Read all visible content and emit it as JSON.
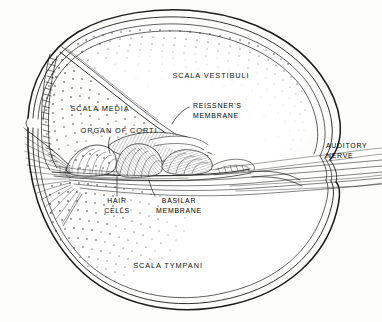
{
  "figure": {
    "type": "anatomical-line-drawing",
    "ink_color": "#1a1a1a",
    "background_color": "#fdfdfb",
    "width": 382,
    "height": 322
  },
  "labels": {
    "scala_vestibuli": {
      "text": "SCALA VESTIBULI",
      "x": 211,
      "y": 78
    },
    "scala_media": {
      "text": "SCALA MEDIA",
      "x": 100,
      "y": 111
    },
    "organ_of_corti": {
      "text": "ORGAN OF CORTI",
      "x": 119,
      "y": 133
    },
    "reissners_membrane": {
      "line1": "REISSNER'S",
      "line2": "MEMBRANE",
      "x": 225,
      "y": 111
    },
    "basilar_membrane": {
      "line1": "BASILAR",
      "line2": "MEMBRANE",
      "x": 172,
      "y": 203
    },
    "hair_cells": {
      "line1": "HAIR",
      "line2": "CELLS",
      "x": 117,
      "y": 203
    },
    "auditory_nerve": {
      "line1": "AUDITORY",
      "line2": "NERVE",
      "x": 347,
      "y": 150
    },
    "scala_tympani": {
      "text": "SCALA TYMPANI",
      "x": 168,
      "y": 268
    }
  },
  "structures": [
    {
      "name": "bony-capsule-outer-wall",
      "description": "multi-line outer contour of the cochlear turn"
    },
    {
      "name": "scala-vestibuli-chamber",
      "description": "upper large chamber, stippled near walls"
    },
    {
      "name": "scala-media-chamber",
      "description": "triangular duct, heavily stippled"
    },
    {
      "name": "scala-tympani-chamber",
      "description": "lower chamber, stippled at left"
    },
    {
      "name": "reissners-membrane-line",
      "description": "thin diagonal membrane separating vestibuli from media"
    },
    {
      "name": "basilar-membrane-line",
      "description": "horizontal membrane floor of scala media"
    },
    {
      "name": "tectorial-membrane",
      "description": "hatched tongue-shaped flap over hair cells"
    },
    {
      "name": "organ-of-corti-cells",
      "description": "hatched supporting and hair cells on basilar membrane"
    },
    {
      "name": "stria-vascularis",
      "description": "column of rectangular cells along left wall"
    },
    {
      "name": "spiral-ganglion-fibers",
      "description": "radiating fiber lines at lower left"
    },
    {
      "name": "auditory-nerve-bundle",
      "description": "sweeping parallel fiber lines exiting to the right"
    }
  ]
}
